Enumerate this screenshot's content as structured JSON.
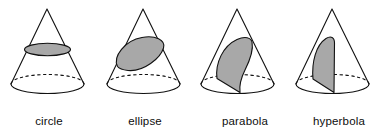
{
  "figure": {
    "background_color": "#ffffff",
    "line_color": "#111111",
    "section_fill_color": "#a8a8a8",
    "label_color": "#0d0d0d",
    "canvas": {
      "width": 382,
      "height": 138
    }
  },
  "cones": [
    {
      "id": "cone-circle",
      "label": "circle",
      "label_x": 49,
      "label_y": 125,
      "apex": {
        "x": 47,
        "y": 9
      },
      "base_center": {
        "x": 47.5,
        "y": 84
      },
      "base_rx": 36.5,
      "base_ry": 9.5,
      "section_type": "circle",
      "section_note": "plane parallel to the base",
      "outline_path": "M47,9 L11,84 M47,9 L84,84",
      "base_front_path": "M11,84 A36.5,9.5 0 0 0 84,84",
      "base_back_path": "M11,84 A36.5,9.5 0 0 1 84,84",
      "section_path": "M24.5,49.5 A23,6.2 0 0 0 70.5,49.5 A23,6.2 0 0 0 24.5,49.5 Z"
    },
    {
      "id": "cone-ellipse",
      "label": "ellipse",
      "label_x": 145,
      "label_y": 125,
      "apex": {
        "x": 143,
        "y": 9
      },
      "base_center": {
        "x": 143.5,
        "y": 84
      },
      "base_rx": 36.5,
      "base_ry": 9.5,
      "section_type": "ellipse",
      "section_note": "plane oblique to the axis cutting all elements",
      "outline_path": "M143,9 L107,84 M143,9 L180,84",
      "base_front_path": "M107,84 A36.5,9.5 0 0 0 180,84",
      "base_back_path": "M107,84 A36.5,9.5 0 0 1 180,84",
      "section_path": "M117.5,66.5 C112.5,56.5 125,40.5 142,37.5 C155,35 166,40 163.5,48 C160.5,58 144,72 128,70.5 C122,69.8 119,68.5 117.5,66.5 Z"
    },
    {
      "id": "cone-parabola",
      "label": "parabola",
      "label_x": 245,
      "label_y": 125,
      "apex": {
        "x": 237,
        "y": 9
      },
      "base_center": {
        "x": 237.5,
        "y": 84
      },
      "base_rx": 36.5,
      "base_ry": 9.5,
      "section_type": "parabola",
      "section_note": "plane parallel to one element of the cone",
      "outline_path": "M237,9 L201,84 M237,9 L274,84",
      "base_front_path": "M201,84 A36.5,9.5 0 0 0 274,84",
      "base_back_path": "M201,84 A36.5,9.5 0 0 1 274,84",
      "section_path": "M217,78.5 C215,63 223,46 237,39.5 C245,35.8 251,37.5 252,42 C253.5,49 250,60 245,70 C241.5,77 239,85 240,92.5 L217,78.5 Z"
    },
    {
      "id": "cone-hyperbola",
      "label": "hyperbola",
      "label_x": 339,
      "label_y": 125,
      "apex": {
        "x": 332,
        "y": 9
      },
      "base_center": {
        "x": 332.5,
        "y": 84
      },
      "base_rx": 36.5,
      "base_ry": 9.5,
      "section_type": "hyperbola",
      "section_note": "plane parallel to the axis of the cone",
      "outline_path": "M332,9 L296,84 M332,9 L369,84",
      "base_front_path": "M296,84 A36.5,9.5 0 0 0 369,84",
      "base_back_path": "M296,84 A36.5,9.5 0 0 1 369,84",
      "section_path": "M313,79 C311.5,62 316,45 326,38.5 C331,35.3 334.5,37.5 334.5,43 L334,92.5 L313,79 Z"
    }
  ]
}
